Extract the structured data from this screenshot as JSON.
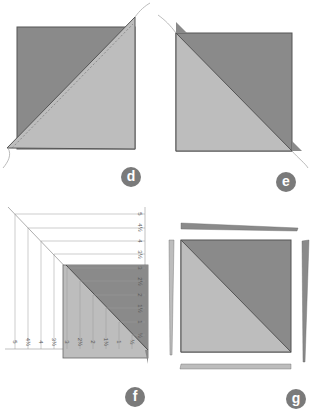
{
  "panels": [
    {
      "id": "d",
      "label": "d"
    },
    {
      "id": "e",
      "label": "e"
    },
    {
      "id": "f",
      "label": "f"
    },
    {
      "id": "g",
      "label": "g"
    }
  ],
  "measure_ticks": [
    "5",
    "4½",
    "4",
    "3½",
    "3",
    "2½",
    "2",
    "1½",
    "1",
    "½"
  ],
  "colors": {
    "dark_fabric": "#8a8a8a",
    "light_fabric": "#bdbdbd",
    "outline": "#555555",
    "badge": "#7a7a7a"
  }
}
